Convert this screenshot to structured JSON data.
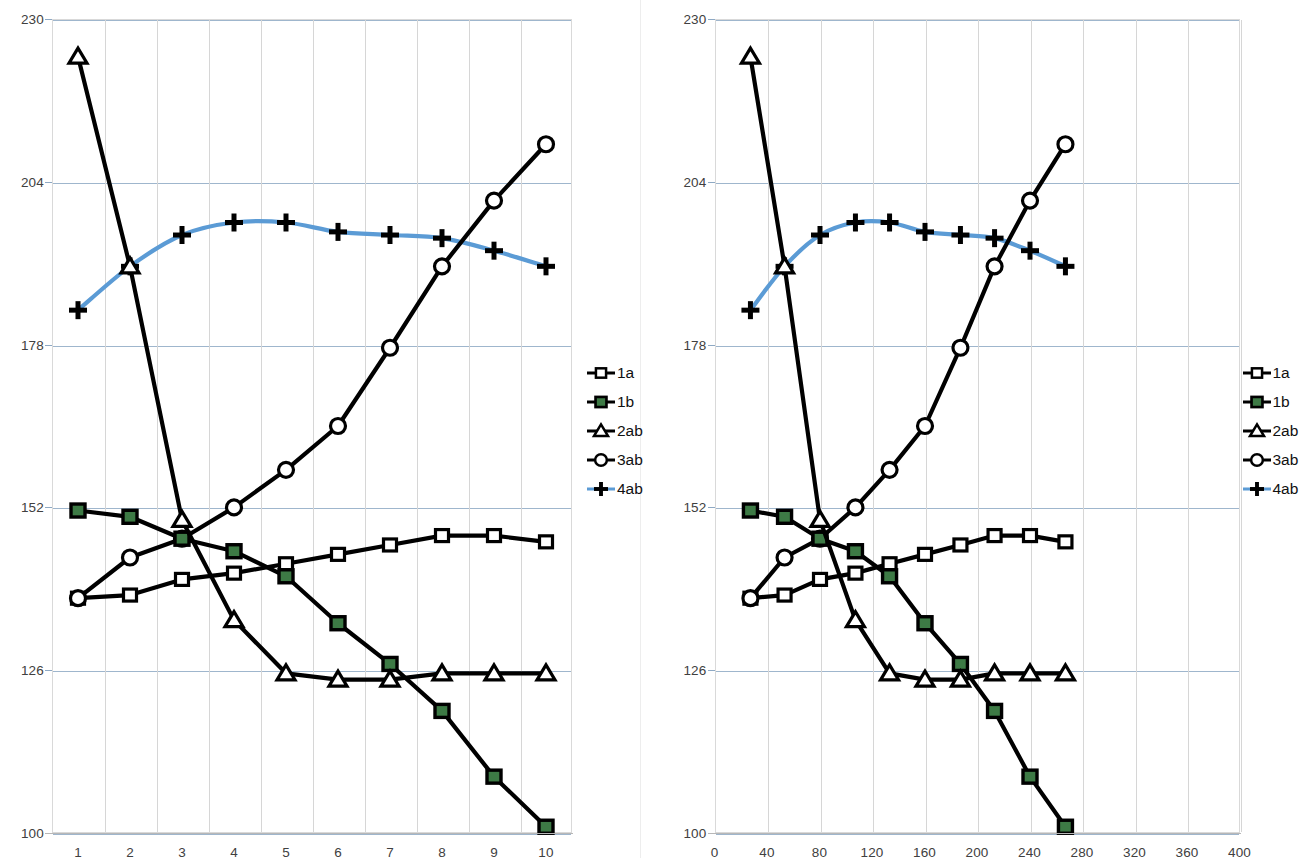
{
  "chart_data": [
    {
      "type": "line",
      "panel": "left",
      "title": "",
      "xlabel": "",
      "ylabel": "",
      "x": [
        1,
        2,
        3,
        4,
        5,
        6,
        7,
        8,
        9,
        10
      ],
      "xticks": [
        "1",
        "2",
        "3",
        "4",
        "5",
        "6",
        "7",
        "8",
        "9",
        "10"
      ],
      "yticks": [
        100,
        126,
        152,
        178,
        204,
        230
      ],
      "ylim": [
        100,
        230
      ],
      "xlim": [
        0.5,
        10.5
      ],
      "grid": true,
      "legend_position": "right",
      "series": [
        {
          "name": "1a",
          "marker": "open-square",
          "color": "#000000",
          "values": [
            137.5,
            138.0,
            140.5,
            141.5,
            143.0,
            144.5,
            146.0,
            147.5,
            147.5,
            146.5
          ]
        },
        {
          "name": "1b",
          "marker": "filled-square",
          "color": "#3d7a45",
          "values": [
            151.5,
            150.5,
            147.0,
            145.0,
            141.0,
            133.5,
            127.0,
            119.5,
            109.0,
            101.0
          ]
        },
        {
          "name": "2ab",
          "marker": "open-triangle",
          "color": "#000000",
          "values": [
            224.0,
            190.5,
            150.0,
            134.0,
            125.5,
            124.5,
            124.5,
            125.5,
            125.5,
            125.5
          ]
        },
        {
          "name": "3ab",
          "marker": "open-circle",
          "color": "#000000",
          "values": [
            137.5,
            144.0,
            147.0,
            152.0,
            158.0,
            165.0,
            177.5,
            190.5,
            201.0,
            210.0
          ]
        },
        {
          "name": "4ab",
          "marker": "plus",
          "color": "#5b9bd5",
          "values": [
            183.5,
            190.5,
            195.5,
            197.5,
            197.5,
            196.0,
            195.5,
            195.0,
            193.0,
            190.5
          ]
        }
      ]
    },
    {
      "type": "line",
      "panel": "right",
      "title": "",
      "xlabel": "",
      "ylabel": "",
      "x": [
        27,
        53,
        80,
        107,
        133,
        160,
        187,
        213,
        240,
        267
      ],
      "xticks": [
        "0",
        "40",
        "80",
        "120",
        "160",
        "200",
        "240",
        "280",
        "320",
        "360",
        "400"
      ],
      "xtickvals": [
        0,
        40,
        80,
        120,
        160,
        200,
        240,
        280,
        320,
        360,
        400
      ],
      "yticks": [
        100,
        126,
        152,
        178,
        204,
        230
      ],
      "ylim": [
        100,
        230
      ],
      "xlim": [
        0,
        400
      ],
      "grid": true,
      "legend_position": "right",
      "series": [
        {
          "name": "1a",
          "marker": "open-square",
          "color": "#000000",
          "values": [
            137.5,
            138.0,
            140.5,
            141.5,
            143.0,
            144.5,
            146.0,
            147.5,
            147.5,
            146.5
          ]
        },
        {
          "name": "1b",
          "marker": "filled-square",
          "color": "#3d7a45",
          "values": [
            151.5,
            150.5,
            147.0,
            145.0,
            141.0,
            133.5,
            127.0,
            119.5,
            109.0,
            101.0
          ]
        },
        {
          "name": "2ab",
          "marker": "open-triangle",
          "color": "#000000",
          "values": [
            224.0,
            190.5,
            150.0,
            134.0,
            125.5,
            124.5,
            124.5,
            125.5,
            125.5,
            125.5
          ]
        },
        {
          "name": "3ab",
          "marker": "open-circle",
          "color": "#000000",
          "values": [
            137.5,
            144.0,
            147.0,
            152.0,
            158.0,
            165.0,
            177.5,
            190.5,
            201.0,
            210.0
          ]
        },
        {
          "name": "4ab",
          "marker": "plus",
          "color": "#5b9bd5",
          "values": [
            183.5,
            190.5,
            195.5,
            197.5,
            197.5,
            196.0,
            195.5,
            195.0,
            193.0,
            190.5
          ]
        }
      ]
    }
  ],
  "legend": {
    "items": [
      {
        "label": "1a",
        "marker": "open-square",
        "color": "#000000"
      },
      {
        "label": "1b",
        "marker": "filled-square",
        "color": "#3d7a45"
      },
      {
        "label": "2ab",
        "marker": "open-triangle",
        "color": "#000000"
      },
      {
        "label": "3ab",
        "marker": "open-circle",
        "color": "#000000"
      },
      {
        "label": "4ab",
        "marker": "plus",
        "color": "#5b9bd5"
      }
    ]
  },
  "colors": {
    "gridline": "#8ea9c4",
    "vertical_gridline": "#d6d6d6",
    "series_black": "#000000",
    "series_green": "#3d7a45",
    "series_blue": "#5b9bd5",
    "tick_text": "#404040"
  }
}
